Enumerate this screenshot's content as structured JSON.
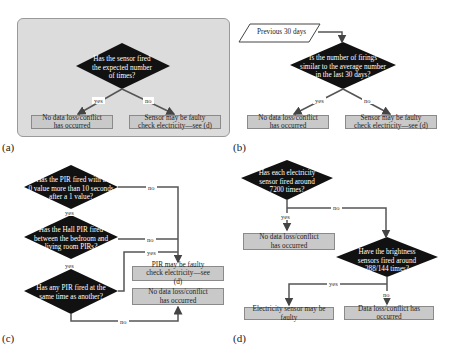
{
  "panels": {
    "a": {
      "label": "(a)",
      "decision": "Has the sensor fired the expected number of times?",
      "decision_lines": [
        "Has the sensor fired",
        "the expected number",
        "of times?"
      ],
      "yes_label": "yes",
      "no_label": "no",
      "yes_outcome": "No data loss/conflict has occurred",
      "no_outcome": "Sensor may be faulty check electricity—see (d)"
    },
    "b": {
      "label": "(b)",
      "input": "Previous 30 days",
      "decision_lines": [
        "Is the number of firings",
        "similar to the average number",
        "in the last 30 days?"
      ],
      "yes_label": "yes",
      "no_label": "no",
      "yes_outcome": "No data loss/conflict has occurred",
      "no_outcome": "Sensor may be faulty check electricity—see (d)"
    },
    "c": {
      "label": "(c)",
      "decision1_lines": [
        "Has the PIR fired with a",
        "0 value more than 10 seconds",
        "after a 1 value?"
      ],
      "decision2_lines": [
        "Has the Hall PIR fired",
        "between the bedroom and",
        "living room PIRs?"
      ],
      "decision3_lines": [
        "Has any PIR fired at the",
        "same time as another?"
      ],
      "d1_no": "no",
      "d1_yes": "yes",
      "d2_no": "no",
      "d2_yes": "yes",
      "d3_yes": "yes",
      "d3_no": "no",
      "outcome_faulty": "PIR may be faulty check electricity—see (d)",
      "outcome_ok": "No data loss/conflict has occurred"
    },
    "d": {
      "label": "(d)",
      "decision1_lines": [
        "Has each electricity",
        "sensor fired around",
        "7200 times?"
      ],
      "decision2_lines": [
        "Have the brightness",
        "sensors fired around",
        "288/144 times?"
      ],
      "d1_yes": "yes",
      "d1_no": "no",
      "d2_yes": "yes",
      "d2_no": "no",
      "outcome_ok": "No data loss/conflict has occurred",
      "outcome_elec": "Electricity sensor may be faulty",
      "outcome_loss": "Data loss/conflict has occurred"
    }
  },
  "colors": {
    "panel_bg": "#dcdcdc",
    "diamond": "#111111",
    "box_bg": "#c9c9c9",
    "arrow": "#555555"
  }
}
